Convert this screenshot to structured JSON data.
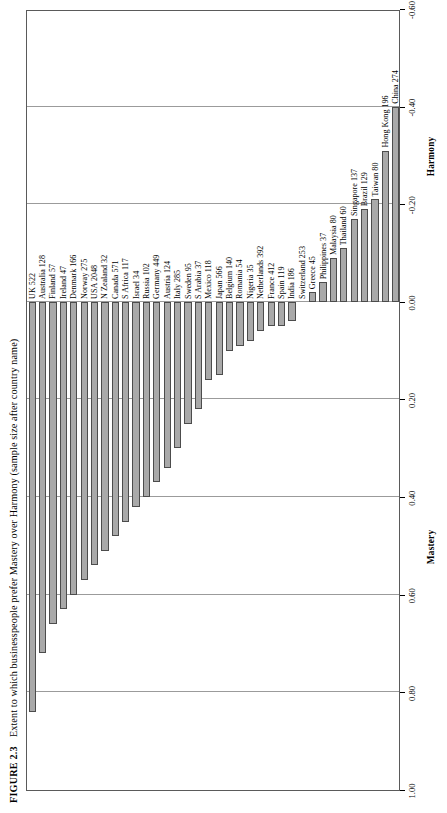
{
  "caption": {
    "figure_number": "FIGURE 2.3",
    "text": "Extent to which businesspeople prefer Mastery over Harmony (sample size after country name)"
  },
  "chart_data": {
    "type": "bar",
    "orientation": "horizontal",
    "title": "Extent to which businesspeople prefer Mastery over Harmony (sample size after country name)",
    "xlabel": "",
    "ylabel": "",
    "axis_titles": [
      "Mastery",
      "Harmony"
    ],
    "value_axis_range": [
      1.0,
      -0.6
    ],
    "tick_labels": [
      "1.00",
      "0.80",
      "0.60",
      "0.40",
      "0.20",
      "0.00",
      "-0.20",
      "-0.40",
      "-0.60"
    ],
    "tick_values": [
      1.0,
      0.8,
      0.6,
      0.4,
      0.2,
      0.0,
      -0.2,
      -0.4,
      -0.6
    ],
    "grid": true,
    "legend": "none",
    "bar_fill_color": "#a9a9a9",
    "bar_edge_color": "#4c4c4c",
    "categories": [
      "UK 522",
      "Australia 128",
      "Finland 57",
      "Ireland 47",
      "Denmark 166",
      "Norway 275",
      "USA 2048",
      "N Zealand 32",
      "Canada 571",
      "S Africa 117",
      "Israel 34",
      "Russia 102",
      "Germany 449",
      "Austria 124",
      "Italy 285",
      "Sweden 95",
      "S Arabia 37",
      "Mexico 118",
      "Japan 566",
      "Belgium 140",
      "Romania 54",
      "Nigeria 35",
      "Netherlands 392",
      "France 412",
      "Spain 119",
      "India 186",
      "Switzerland 253",
      "Greece 45",
      "Philippines 37",
      "Malaysia 80",
      "Thailand 60",
      "Singapore 137",
      "Brazil 129",
      "Taiwan 80",
      "Hong Kong 196",
      "China 274"
    ],
    "values": [
      0.84,
      0.72,
      0.66,
      0.63,
      0.6,
      0.57,
      0.54,
      0.51,
      0.48,
      0.45,
      0.42,
      0.4,
      0.37,
      0.34,
      0.3,
      0.25,
      0.22,
      0.16,
      0.15,
      0.1,
      0.09,
      0.08,
      0.06,
      0.05,
      0.05,
      0.04,
      0.0,
      -0.02,
      -0.04,
      -0.09,
      -0.11,
      -0.17,
      -0.19,
      -0.21,
      -0.31,
      -0.4
    ]
  }
}
